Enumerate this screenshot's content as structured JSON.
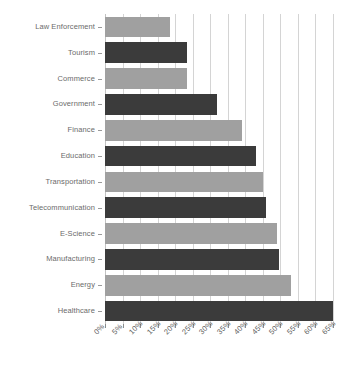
{
  "chart_data": {
    "type": "bar",
    "orientation": "horizontal",
    "title": "",
    "xlabel": "",
    "ylabel": "",
    "xlim": [
      0,
      65
    ],
    "grid": true,
    "legend": "none",
    "xtick_labels": [
      "0%",
      "5%",
      "10%",
      "15%",
      "20%",
      "25%",
      "30%",
      "35%",
      "40%",
      "45%",
      "50%",
      "55%",
      "60%",
      "65%"
    ],
    "xtick_values": [
      0,
      5,
      10,
      15,
      20,
      25,
      30,
      35,
      40,
      45,
      50,
      55,
      60,
      65
    ],
    "categories": [
      "Law Enforcement",
      "Tourism",
      "Commerce",
      "Government",
      "Finance",
      "Education",
      "Transportation",
      "Telecommunication",
      "E-Science",
      "Manufacturing",
      "Energy",
      "Healthcare"
    ],
    "values": [
      18.5,
      23.5,
      23.5,
      32.0,
      39.0,
      43.0,
      45.0,
      46.0,
      49.0,
      49.5,
      53.0,
      65.0
    ],
    "bar_colors": [
      "#a0a0a0",
      "#3b3b3b",
      "#a0a0a0",
      "#3b3b3b",
      "#a0a0a0",
      "#3b3b3b",
      "#a0a0a0",
      "#3b3b3b",
      "#a0a0a0",
      "#3b3b3b",
      "#a0a0a0",
      "#3b3b3b"
    ],
    "colors": {
      "light_bar": "#a0a0a0",
      "dark_bar": "#3b3b3b",
      "gridline": "#d4d4d4",
      "axis_text": "#6b6b6b",
      "background": "#ffffff"
    }
  }
}
